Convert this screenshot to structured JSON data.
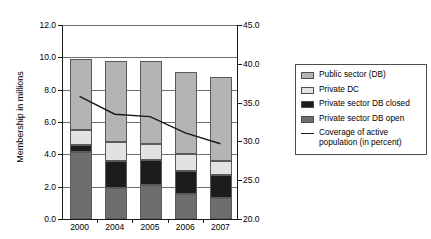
{
  "chart_data": {
    "type": "bar",
    "title": "",
    "subtitle": "",
    "xlabel": "",
    "ylabel": "Membership in millions",
    "y2label": "Percent",
    "categories": [
      "2000",
      "2004",
      "2005",
      "2006",
      "2007"
    ],
    "ylim": [
      0.0,
      12.0
    ],
    "yticks": [
      "0.0",
      "2.0",
      "4.0",
      "6.0",
      "8.0",
      "10.0",
      "12.0"
    ],
    "ytick_values": [
      0.0,
      2.0,
      4.0,
      6.0,
      8.0,
      10.0,
      12.0
    ],
    "y2lim": [
      20.0,
      45.0
    ],
    "y2ticks": [
      "20.0",
      "25.0",
      "30.0",
      "35.0",
      "40.0",
      "45.0"
    ],
    "y2tick_values": [
      20.0,
      25.0,
      30.0,
      35.0,
      40.0,
      45.0
    ],
    "grid": true,
    "stacked": true,
    "legend_position": "right",
    "series": [
      {
        "name": "Private sector DB open",
        "color": "#6e6e6e",
        "axis": "left",
        "values": [
          4.15,
          1.9,
          2.1,
          1.55,
          1.3
        ]
      },
      {
        "name": "Private sector DB closed",
        "color": "#1c1c1c",
        "axis": "left",
        "values": [
          0.45,
          1.7,
          1.55,
          1.45,
          1.4
        ]
      },
      {
        "name": "Private DC",
        "color": "#e2e2e2",
        "axis": "left",
        "values": [
          0.9,
          1.15,
          1.0,
          1.05,
          0.9
        ]
      },
      {
        "name": "Public sector (DB)",
        "color": "#b4b4b4",
        "axis": "left",
        "values": [
          4.4,
          5.05,
          5.1,
          5.05,
          5.2
        ]
      },
      {
        "name": "Coverage of active population (in percent)",
        "color": "#1a1a1a",
        "axis": "right",
        "type": "line",
        "values": [
          35.8,
          33.5,
          33.2,
          31.1,
          29.7
        ]
      }
    ],
    "stack_totals": [
      9.9,
      9.8,
      9.75,
      9.1,
      8.8
    ]
  },
  "legend": {
    "items": [
      {
        "label": "Public sector (DB)",
        "swatch": "legend-swatch-public-sector-db",
        "color": "#b4b4b4",
        "kind": "box"
      },
      {
        "label": "Private DC",
        "swatch": "legend-swatch-private-dc",
        "color": "#e2e2e2",
        "kind": "box"
      },
      {
        "label": "Private sector DB closed",
        "swatch": "legend-swatch-private-db-closed",
        "color": "#1c1c1c",
        "kind": "box"
      },
      {
        "label": "Private sector DB open",
        "swatch": "legend-swatch-private-db-open",
        "color": "#6e6e6e",
        "kind": "box"
      },
      {
        "label": "Coverage of active population (in percent)",
        "swatch": "legend-swatch-coverage-line",
        "color": "#1a1a1a",
        "kind": "line"
      }
    ]
  }
}
